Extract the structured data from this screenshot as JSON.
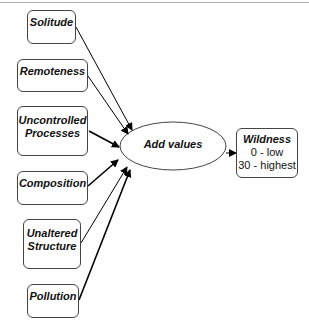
{
  "inputs": [
    {
      "id": "solitude",
      "label": "Solitude"
    },
    {
      "id": "remoteness",
      "label": "Remoteness"
    },
    {
      "id": "uncontrolled",
      "label": "Uncontrolled Processes"
    },
    {
      "id": "composition",
      "label": "Composition"
    },
    {
      "id": "unaltered",
      "label": "Unaltered Structure"
    },
    {
      "id": "pollution",
      "label": "Pollution"
    }
  ],
  "operation": {
    "label": "Add values"
  },
  "output": {
    "title": "Wildness",
    "low": "0 - low",
    "high": "30 - highest"
  }
}
